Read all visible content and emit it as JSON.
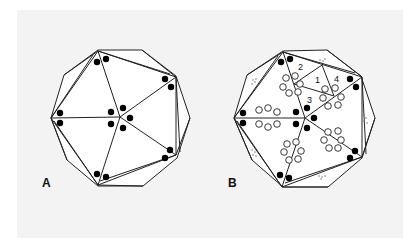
{
  "figure": {
    "panels": [
      {
        "id": "A",
        "label": "A",
        "description": "Decagonal outline enclosing a five-vertex star triangulation with paired black dots at each vertex and five black dots around the center",
        "center": [
          120,
          117
        ],
        "vertices": [
          [
            98,
            51
          ],
          [
            176,
            77
          ],
          [
            176,
            155
          ],
          [
            98,
            185
          ],
          [
            51,
            118
          ]
        ],
        "decagon": [
          [
            98,
            50
          ],
          [
            142,
            50
          ],
          [
            176,
            75
          ],
          [
            191,
            118
          ],
          [
            178,
            158
          ],
          [
            175,
            162
          ],
          [
            143,
            187
          ],
          [
            98,
            186
          ],
          [
            67,
            160
          ],
          [
            51,
            118
          ],
          [
            63,
            75
          ]
        ]
      },
      {
        "id": "B",
        "label": "B",
        "description": "Same decagonal triangulation with rosettes of open circles along the inner edges, small dotted marks in the outer triangles, and numbered sub-triangles 1-4",
        "numbers": [
          "1",
          "2",
          "3",
          "4"
        ],
        "center": [
          305,
          118
        ],
        "vertices": [
          [
            283,
            52
          ],
          [
            362,
            77
          ],
          [
            362,
            157
          ],
          [
            282,
            187
          ],
          [
            234,
            118
          ]
        ]
      }
    ],
    "colors": {
      "background": "#f3f3f3",
      "line": "#222222",
      "dot_fill": "#000000",
      "open_circle_fill": "#ffffff"
    }
  }
}
